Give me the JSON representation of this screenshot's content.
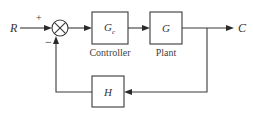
{
  "diagram": {
    "type": "feedback-control-block-diagram",
    "input": {
      "label": "R"
    },
    "output": {
      "label": "C"
    },
    "summing_junction": {
      "plus_sign": "+",
      "minus_sign": "−"
    },
    "blocks": [
      {
        "id": "controller",
        "symbol": "G",
        "subscript": "c",
        "caption": "Controller"
      },
      {
        "id": "plant",
        "symbol": "G",
        "subscript": "",
        "caption": "Plant"
      },
      {
        "id": "feedback",
        "symbol": "H",
        "subscript": "",
        "caption": ""
      }
    ],
    "connections": [
      {
        "from": "R",
        "to": "summing_junction",
        "sign": "+"
      },
      {
        "from": "summing_junction",
        "to": "controller"
      },
      {
        "from": "controller",
        "to": "plant"
      },
      {
        "from": "plant",
        "to": "C"
      },
      {
        "from": "C",
        "to": "feedback"
      },
      {
        "from": "feedback",
        "to": "summing_junction",
        "sign": "−"
      }
    ],
    "colors": {
      "line": "#3a3a3a",
      "text": "#333333",
      "background": "#ffffff"
    }
  }
}
